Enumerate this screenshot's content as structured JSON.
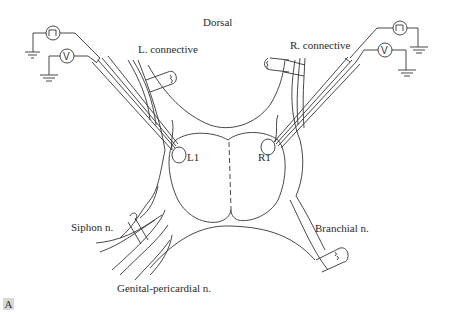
{
  "figure": {
    "panel_label": "A",
    "labels": {
      "dorsal": "Dorsal",
      "left_connective": "L. connective",
      "right_connective": "R. connective",
      "left_cell": "L1",
      "right_cell": "R1",
      "siphon_nerve": "Siphon n.",
      "branchial_nerve": "Branchial n.",
      "genital_pericardial_nerve": "Genital-pericardial n."
    },
    "instruments": {
      "left_stimulator_icon": "square-pulse-icon",
      "left_voltmeter_symbol": "V",
      "right_stimulator_icon": "square-pulse-icon",
      "right_voltmeter_symbol": "V"
    },
    "colors": {
      "line": "#333333",
      "panel_label_bg": "#d8d8d8"
    }
  }
}
